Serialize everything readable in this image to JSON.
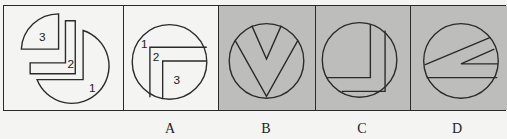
{
  "figure": {
    "question_panel": {
      "piece_labels": [
        "1",
        "2",
        "3"
      ],
      "background": "#f4f4f2"
    },
    "options": [
      {
        "label": "A",
        "background": "#f4f4f2",
        "piece_labels": [
          "1",
          "2",
          "3"
        ]
      },
      {
        "label": "B",
        "background": "#bdbdbb"
      },
      {
        "label": "C",
        "background": "#bdbdbb"
      },
      {
        "label": "D",
        "background": "#bdbdbb"
      }
    ],
    "stroke_color": "#2a2a2a"
  }
}
